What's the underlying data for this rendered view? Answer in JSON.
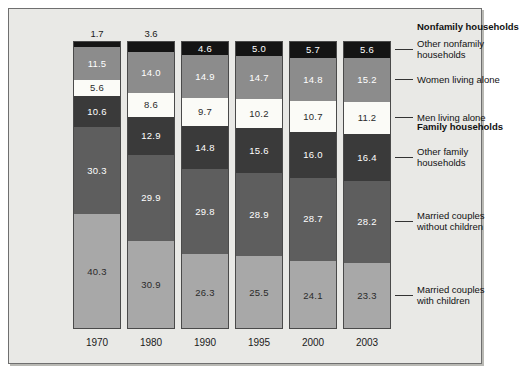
{
  "chart_data": {
    "type": "bar",
    "subtype": "stacked-percent",
    "title": "",
    "xlabel": "",
    "ylabel": "",
    "ylim": [
      0,
      100
    ],
    "grid": false,
    "legend_position": "right",
    "categories": [
      "1970",
      "1980",
      "1990",
      "1995",
      "2000",
      "2003"
    ],
    "series": [
      {
        "name": "Other nonfamily households",
        "color": "#141414",
        "values": [
          1.7,
          3.6,
          4.6,
          5.0,
          5.7,
          5.6
        ]
      },
      {
        "name": "Women living alone",
        "color": "#8c8c8c",
        "values": [
          11.5,
          14.0,
          14.9,
          14.7,
          14.8,
          15.2
        ]
      },
      {
        "name": "Men living alone",
        "color": "#fbfbf7",
        "values": [
          5.6,
          8.6,
          9.7,
          10.2,
          10.7,
          11.2
        ]
      },
      {
        "name": "Other family households",
        "color": "#3a3a3a",
        "values": [
          10.6,
          12.9,
          14.8,
          15.6,
          16.0,
          16.4
        ]
      },
      {
        "name": "Married couples without children",
        "color": "#5e5e5e",
        "values": [
          30.3,
          29.9,
          29.8,
          28.9,
          28.7,
          28.2
        ]
      },
      {
        "name": "Married couples with children",
        "color": "#a8a8a8",
        "values": [
          40.3,
          30.9,
          26.3,
          25.5,
          24.1,
          23.3
        ]
      }
    ],
    "group_headers": [
      {
        "label": "Nonfamily households",
        "covers": [
          "Other nonfamily households",
          "Women living alone",
          "Men living alone"
        ]
      },
      {
        "label": "Family households",
        "covers": [
          "Other family households",
          "Married couples without children",
          "Married couples with children"
        ]
      }
    ],
    "legend_entries": [
      {
        "label_line1": "Other nonfamily",
        "label_line2": "households"
      },
      {
        "label_line1": "Women living alone",
        "label_line2": ""
      },
      {
        "label_line1": "Men living alone",
        "label_line2": ""
      },
      {
        "label_line1": "Other family",
        "label_line2": "households"
      },
      {
        "label_line1": "Married couples",
        "label_line2": "without children"
      },
      {
        "label_line1": "Married couples",
        "label_line2": "with children"
      }
    ]
  }
}
